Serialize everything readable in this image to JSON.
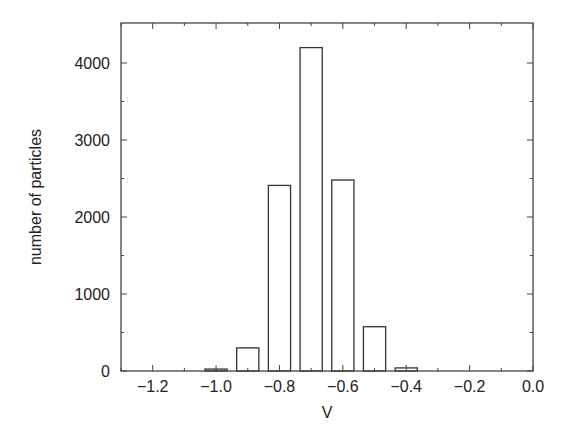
{
  "chart_data": {
    "type": "bar",
    "title": "",
    "xlabel": "V",
    "ylabel": "number of particles",
    "xlim": [
      -1.3,
      0.0
    ],
    "ylim": [
      0,
      4400
    ],
    "x": [
      -1.0,
      -0.9,
      -0.8,
      -0.7,
      -0.6,
      -0.5,
      -0.4
    ],
    "values": [
      25,
      300,
      2410,
      4200,
      2480,
      575,
      40
    ],
    "bar_width": 0.07,
    "xticks": [
      -1.2,
      -1.0,
      -0.8,
      -0.6,
      -0.4,
      -0.2,
      0.0
    ],
    "xtick_labels": [
      "−1.2",
      "−1.0",
      "−0.8",
      "−0.6",
      "−0.4",
      "−0.2",
      "0.0"
    ],
    "yticks": [
      0,
      1000,
      2000,
      3000,
      4000
    ],
    "ytick_labels": [
      "0",
      "1000",
      "2000",
      "3000",
      "4000"
    ],
    "grid": false,
    "legend": null,
    "bar_style": "outline",
    "colors": {
      "bar_edge": "#333333",
      "bar_fill": "#ffffff",
      "axis": "#444444"
    }
  }
}
